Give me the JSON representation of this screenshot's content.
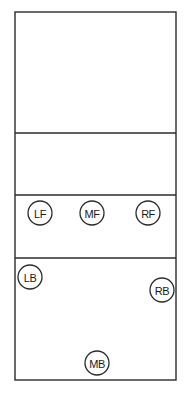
{
  "diagram": {
    "type": "volleyball-court-positions",
    "colors": {
      "line": "#2b2b2b",
      "background": "#ffffff",
      "text": "#1a1a1a"
    },
    "court": {
      "x": 15,
      "y": 12,
      "width": 161,
      "height": 368
    },
    "lines": [
      {
        "name": "upper-divider",
        "y": 133
      },
      {
        "name": "net-line",
        "y": 195
      },
      {
        "name": "attack-line",
        "y": 258
      }
    ],
    "players": [
      {
        "id": "lf",
        "label": "LF",
        "cx": 40,
        "cy": 213,
        "r": 12
      },
      {
        "id": "mf",
        "label": "MF",
        "cx": 92,
        "cy": 213,
        "r": 12
      },
      {
        "id": "rf",
        "label": "RF",
        "cx": 148,
        "cy": 213,
        "r": 12
      },
      {
        "id": "lb",
        "label": "LB",
        "cx": 30,
        "cy": 277,
        "r": 12
      },
      {
        "id": "rb",
        "label": "RB",
        "cx": 162,
        "cy": 290,
        "r": 12
      },
      {
        "id": "mb",
        "label": "MB",
        "cx": 97,
        "cy": 363,
        "r": 12
      }
    ]
  }
}
